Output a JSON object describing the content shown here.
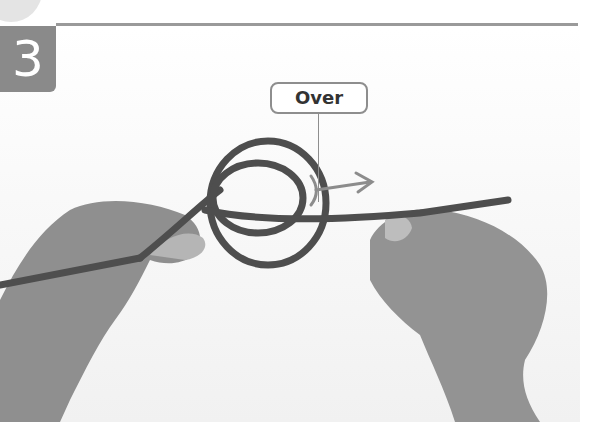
{
  "step": {
    "number": "3"
  },
  "callout": {
    "label": "Over"
  },
  "illustration": {
    "subject": "two hands tying rope loop",
    "arrow_color": "#8c8c8c",
    "rope_color": "#4e4e4e",
    "skin_color": "#9a9a9a"
  }
}
